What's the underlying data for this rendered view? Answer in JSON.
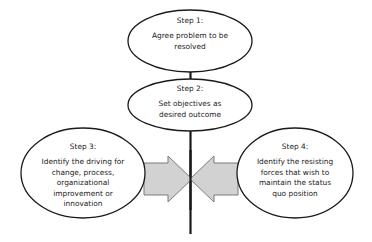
{
  "diagram": {
    "type": "force-field-analysis",
    "center_axis": {
      "name": "center-vertical-line",
      "color": "#1a1a1a"
    },
    "colors": {
      "ellipse_stroke": "#1a1a1a",
      "ellipse_fill": "#ffffff",
      "arrow_fill": "#d2d2d2",
      "arrow_stroke": "#6e6e6e",
      "text": "#1a1a1a"
    },
    "nodes": [
      {
        "id": "step-1",
        "title": "Step 1:",
        "body": "Agree problem to be resolved",
        "body_lines": [
          "Agree problem to be",
          "resolved"
        ]
      },
      {
        "id": "step-2",
        "title": "Step 2:",
        "body": "Set objectives as desired outcome",
        "body_lines": [
          "Set objectives as",
          "desired outcome"
        ]
      },
      {
        "id": "step-3",
        "title": "Step 3:",
        "body": "Identify the driving for change, process, organizational improvement or innovation",
        "body_lines": [
          "Identify the driving for",
          "change, process,",
          "organizational",
          "improvement or",
          "innovation"
        ]
      },
      {
        "id": "step-4",
        "title": "Step 4:",
        "body": "Identify the resisting forces that wish to maintain the status quo position",
        "body_lines": [
          "Identify the resisting",
          "forces that wish to",
          "maintain the status",
          "quo position"
        ]
      }
    ],
    "arrows": [
      {
        "id": "driving-forces-arrow",
        "direction": "right"
      },
      {
        "id": "resisting-forces-arrow",
        "direction": "left"
      }
    ]
  },
  "labels": {
    "step1_title": "Step 1:",
    "step1_line1": "Agree problem to be",
    "step1_line2": "resolved",
    "step2_title": "Step 2:",
    "step2_line1": "Set objectives as",
    "step2_line2": "desired outcome",
    "step3_title": "Step 3:",
    "step3_line1": "Identify the driving for",
    "step3_line2": "change, process,",
    "step3_line3": "organizational",
    "step3_line4": "improvement or",
    "step3_line5": "innovation",
    "step4_title": "Step 4:",
    "step4_line1": "Identify the resisting",
    "step4_line2": "forces that wish to",
    "step4_line3": "maintain the status",
    "step4_line4": "quo position"
  }
}
